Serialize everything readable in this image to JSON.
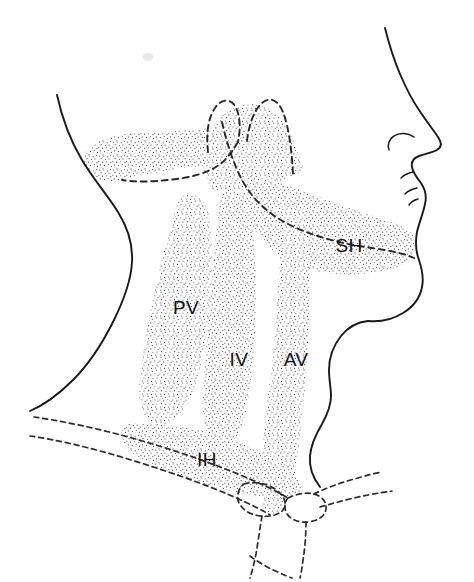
{
  "figure": {
    "view": "lateral",
    "background_color": "#ffffff",
    "ink_color": "#1a1a1a",
    "stipple_color": "#4a4a4a"
  },
  "labels": [
    {
      "id": "sh",
      "text": "SH",
      "meaning": "suprahyoid space",
      "x": 349,
      "y": 252
    },
    {
      "id": "pv",
      "text": "PV",
      "meaning": "prevertebral space",
      "x": 186,
      "y": 314
    },
    {
      "id": "iv",
      "text": "IV",
      "meaning": "visceral / intervisceral space",
      "x": 239,
      "y": 366
    },
    {
      "id": "av",
      "text": "AV",
      "meaning": "anterior visceral space",
      "x": 296,
      "y": 366
    },
    {
      "id": "ih",
      "text": "IH",
      "meaning": "infrahyoid space",
      "x": 207,
      "y": 466
    }
  ],
  "anatomy": {
    "solid_outlines": [
      "facial-profile",
      "posterior-neck-contour",
      "anterior-neck-contour"
    ],
    "dashed_outlines": [
      "mandible-body",
      "mandibular-condyle-left",
      "mandibular-condyle-right",
      "clavicle-upper",
      "clavicle-lower",
      "manubrium-sternum",
      "sternoclavicular-joint"
    ],
    "stippled_regions": [
      "retropharyngeal-band",
      "suprahyoid-space",
      "prevertebral-space",
      "visceral-space",
      "anterior-visceral-space",
      "infrahyoid-space"
    ]
  }
}
